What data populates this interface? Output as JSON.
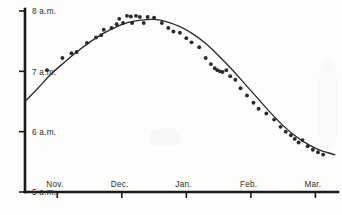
{
  "chart_data": {
    "type": "scatter",
    "title": "",
    "subtitle": "",
    "xlabel": "",
    "ylabel": "",
    "grid": false,
    "legend": null,
    "ylim": [
      5,
      8
    ],
    "ytick_labels": [
      "8 a.m.",
      "7 a.m.",
      "6 a.m.",
      "5 a.m."
    ],
    "ytick_values": [
      8,
      7,
      6,
      5
    ],
    "xtick_labels": [
      "Nov.",
      "Dec.",
      "Jan.",
      "Feb.",
      "Mar."
    ],
    "xtick_values": [
      0.5,
      1.5,
      2.5,
      3.5,
      4.5
    ],
    "xlim": [
      0,
      4.85
    ],
    "series": [
      {
        "name": "Sunrise time observations",
        "type": "scatter",
        "points": [
          {
            "x": 0.34,
            "y": 7.02
          },
          {
            "x": 0.58,
            "y": 7.22
          },
          {
            "x": 0.72,
            "y": 7.3
          },
          {
            "x": 0.8,
            "y": 7.32
          },
          {
            "x": 0.96,
            "y": 7.47
          },
          {
            "x": 1.1,
            "y": 7.56
          },
          {
            "x": 1.18,
            "y": 7.6
          },
          {
            "x": 1.22,
            "y": 7.69
          },
          {
            "x": 1.34,
            "y": 7.72
          },
          {
            "x": 1.42,
            "y": 7.78
          },
          {
            "x": 1.46,
            "y": 7.87
          },
          {
            "x": 1.52,
            "y": 7.8
          },
          {
            "x": 1.58,
            "y": 7.92
          },
          {
            "x": 1.64,
            "y": 7.91
          },
          {
            "x": 1.66,
            "y": 7.8
          },
          {
            "x": 1.72,
            "y": 7.92
          },
          {
            "x": 1.78,
            "y": 7.9
          },
          {
            "x": 1.84,
            "y": 7.8
          },
          {
            "x": 1.9,
            "y": 7.9
          },
          {
            "x": 2.0,
            "y": 7.89
          },
          {
            "x": 2.12,
            "y": 7.8
          },
          {
            "x": 2.22,
            "y": 7.72
          },
          {
            "x": 2.3,
            "y": 7.66
          },
          {
            "x": 2.4,
            "y": 7.64
          },
          {
            "x": 2.5,
            "y": 7.55
          },
          {
            "x": 2.58,
            "y": 7.48
          },
          {
            "x": 2.7,
            "y": 7.4
          },
          {
            "x": 2.8,
            "y": 7.22
          },
          {
            "x": 2.88,
            "y": 7.12
          },
          {
            "x": 2.94,
            "y": 7.05
          },
          {
            "x": 2.98,
            "y": 7.02
          },
          {
            "x": 3.02,
            "y": 7.0
          },
          {
            "x": 3.06,
            "y": 6.99
          },
          {
            "x": 3.12,
            "y": 7.02
          },
          {
            "x": 3.18,
            "y": 6.92
          },
          {
            "x": 3.26,
            "y": 6.86
          },
          {
            "x": 3.34,
            "y": 6.72
          },
          {
            "x": 3.44,
            "y": 6.6
          },
          {
            "x": 3.54,
            "y": 6.48
          },
          {
            "x": 3.62,
            "y": 6.38
          },
          {
            "x": 3.74,
            "y": 6.3
          },
          {
            "x": 3.86,
            "y": 6.2
          },
          {
            "x": 3.96,
            "y": 6.08
          },
          {
            "x": 4.04,
            "y": 6.0
          },
          {
            "x": 4.12,
            "y": 5.94
          },
          {
            "x": 4.18,
            "y": 5.88
          },
          {
            "x": 4.24,
            "y": 5.82
          },
          {
            "x": 4.3,
            "y": 5.86
          },
          {
            "x": 4.38,
            "y": 5.76
          },
          {
            "x": 4.46,
            "y": 5.7
          },
          {
            "x": 4.54,
            "y": 5.66
          },
          {
            "x": 4.62,
            "y": 5.62
          }
        ]
      },
      {
        "name": "Fitted curve",
        "type": "line",
        "points": [
          {
            "x": 0.0,
            "y": 6.5
          },
          {
            "x": 0.2,
            "y": 6.72
          },
          {
            "x": 0.4,
            "y": 6.95
          },
          {
            "x": 0.6,
            "y": 7.14
          },
          {
            "x": 0.8,
            "y": 7.32
          },
          {
            "x": 1.0,
            "y": 7.48
          },
          {
            "x": 1.2,
            "y": 7.62
          },
          {
            "x": 1.4,
            "y": 7.73
          },
          {
            "x": 1.6,
            "y": 7.81
          },
          {
            "x": 1.8,
            "y": 7.85
          },
          {
            "x": 2.0,
            "y": 7.86
          },
          {
            "x": 2.2,
            "y": 7.82
          },
          {
            "x": 2.4,
            "y": 7.74
          },
          {
            "x": 2.6,
            "y": 7.62
          },
          {
            "x": 2.8,
            "y": 7.46
          },
          {
            "x": 3.0,
            "y": 7.26
          },
          {
            "x": 3.2,
            "y": 7.04
          },
          {
            "x": 3.4,
            "y": 6.8
          },
          {
            "x": 3.6,
            "y": 6.56
          },
          {
            "x": 3.8,
            "y": 6.32
          },
          {
            "x": 4.0,
            "y": 6.1
          },
          {
            "x": 4.2,
            "y": 5.92
          },
          {
            "x": 4.4,
            "y": 5.78
          },
          {
            "x": 4.6,
            "y": 5.68
          },
          {
            "x": 4.8,
            "y": 5.62
          }
        ]
      }
    ]
  }
}
